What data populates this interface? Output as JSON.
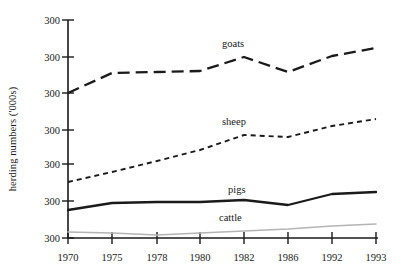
{
  "chart_data": {
    "type": "line",
    "title": "",
    "xlabel": "",
    "ylabel": "herding numbers ('000s)",
    "categories": [
      "1970",
      "1975",
      "1978",
      "1980",
      "1982",
      "1986",
      "1992",
      "1993"
    ],
    "y_tick_labels": [
      "300",
      "300",
      "300",
      "300",
      "300",
      "300",
      "300"
    ],
    "grid": false,
    "legend_position": "inline-labels",
    "series": [
      {
        "name": "goats",
        "style": "long-dash",
        "color": "#1a1a1a",
        "values": [
          93,
          73,
          72,
          71,
          57,
          72,
          56,
          48
        ],
        "label_x": 222,
        "label_y": 38
      },
      {
        "name": "sheep",
        "style": "short-dash",
        "color": "#1a1a1a",
        "values": [
          182,
          172,
          161,
          150,
          135,
          137,
          126,
          119
        ],
        "label_x": 222,
        "label_y": 116
      },
      {
        "name": "pigs",
        "style": "solid-thick",
        "color": "#1a1a1a",
        "values": [
          210,
          203,
          202,
          202,
          200,
          205,
          194,
          192
        ],
        "label_x": 228,
        "label_y": 184
      },
      {
        "name": "cattle",
        "style": "solid-thin-gray",
        "color": "#b4b4b4",
        "values": [
          232,
          233,
          235,
          233,
          231,
          229,
          226,
          224
        ],
        "label_x": 219,
        "label_y": 212
      }
    ],
    "axis": {
      "x_positions": [
        68,
        112,
        157,
        200,
        244,
        288,
        332,
        376
      ],
      "y_positions": [
        20,
        57,
        93,
        130,
        164,
        201,
        238
      ],
      "x_axis_y": 238,
      "y_axis_x": 68,
      "axis_color": "#1a1a1a"
    }
  }
}
